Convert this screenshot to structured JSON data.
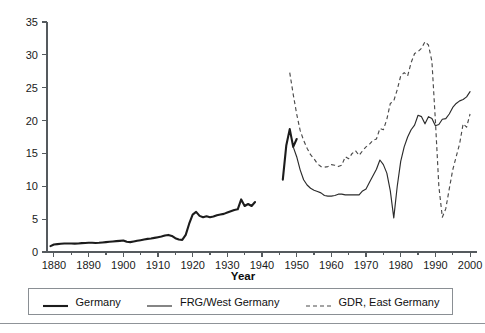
{
  "figure": {
    "background_color": "#ffffff",
    "frame_color": "#8a8f94"
  },
  "chart_data": {
    "type": "line",
    "title": "",
    "subtitle": "",
    "xlabel": "Year",
    "ylabel": "",
    "xlim": [
      1878,
      2002
    ],
    "ylim": [
      0,
      35
    ],
    "grid": false,
    "legend_position": "bottom",
    "x_ticks_major": [
      1880,
      1890,
      1900,
      1910,
      1920,
      1930,
      1940,
      1950,
      1960,
      1970,
      1980,
      1990,
      2000
    ],
    "x_tick_labels": [
      "1880",
      "1890",
      "1900",
      "1910",
      "1920",
      "1930",
      "1940",
      "1950",
      "1960",
      "1970",
      "1980",
      "1990",
      "2000"
    ],
    "x_ticks_minor": [
      1885,
      1895,
      1905,
      1915,
      1925,
      1935,
      1945,
      1955,
      1965,
      1975,
      1985,
      1995
    ],
    "y_ticks_major": [
      0,
      5,
      10,
      15,
      20,
      25,
      30,
      35
    ],
    "y_tick_labels": [
      "0",
      "5",
      "10",
      "15",
      "20",
      "25",
      "30",
      "35"
    ],
    "series": [
      {
        "name": "Germany",
        "style": "solid-thick",
        "color": "#1c1c1c",
        "x": [
          1879,
          1880,
          1881,
          1882,
          1883,
          1884,
          1885,
          1886,
          1887,
          1888,
          1889,
          1890,
          1891,
          1892,
          1893,
          1894,
          1895,
          1896,
          1897,
          1898,
          1899,
          1900,
          1901,
          1902,
          1903,
          1904,
          1905,
          1906,
          1907,
          1908,
          1909,
          1910,
          1911,
          1912,
          1913,
          1914,
          1915,
          1916,
          1917,
          1918,
          1919,
          1920,
          1921,
          1922,
          1923,
          1924,
          1925,
          1926,
          1927,
          1928,
          1929,
          1930,
          1931,
          1932,
          1933,
          1934,
          1935,
          1936,
          1937,
          1938,
          1946,
          1947,
          1948,
          1949,
          1950
        ],
        "values": [
          0.9,
          1.15,
          1.2,
          1.25,
          1.3,
          1.3,
          1.3,
          1.28,
          1.3,
          1.35,
          1.38,
          1.4,
          1.4,
          1.38,
          1.4,
          1.45,
          1.5,
          1.55,
          1.6,
          1.65,
          1.7,
          1.75,
          1.55,
          1.5,
          1.6,
          1.7,
          1.8,
          1.9,
          2.0,
          2.05,
          2.15,
          2.25,
          2.35,
          2.5,
          2.6,
          2.45,
          2.1,
          1.9,
          1.85,
          2.6,
          4.3,
          5.7,
          6.1,
          5.5,
          5.3,
          5.45,
          5.3,
          5.4,
          5.6,
          5.7,
          5.8,
          6.0,
          6.2,
          6.4,
          6.5,
          8.0,
          7.0,
          7.3,
          7.0,
          7.6,
          11.0,
          16.2,
          18.7,
          16.0,
          17.2
        ]
      },
      {
        "name": "FRG/West Germany",
        "style": "solid-thin",
        "color": "#2b2b2b",
        "x": [
          1949,
          1950,
          1951,
          1952,
          1953,
          1954,
          1955,
          1956,
          1957,
          1958,
          1959,
          1960,
          1961,
          1962,
          1963,
          1964,
          1965,
          1966,
          1967,
          1968,
          1969,
          1970,
          1971,
          1972,
          1973,
          1974,
          1975,
          1976,
          1977,
          1978,
          1979,
          1980,
          1981,
          1982,
          1983,
          1984,
          1985,
          1986,
          1987,
          1988,
          1989,
          1990,
          1991,
          1992,
          1993,
          1994,
          1995,
          1996,
          1997,
          1998,
          1999,
          2000
        ],
        "values": [
          16.0,
          14.5,
          12.5,
          11.0,
          10.2,
          9.7,
          9.4,
          9.2,
          9.0,
          8.6,
          8.5,
          8.5,
          8.6,
          8.8,
          8.8,
          8.7,
          8.7,
          8.7,
          8.7,
          8.7,
          9.3,
          9.6,
          10.6,
          11.6,
          12.6,
          14.0,
          13.3,
          12.0,
          9.3,
          5.2,
          10.0,
          13.8,
          16.0,
          17.5,
          18.6,
          19.3,
          20.8,
          20.6,
          19.5,
          20.6,
          20.3,
          19.2,
          19.4,
          20.2,
          20.3,
          21.0,
          22.0,
          22.6,
          23.0,
          23.2,
          23.6,
          24.4
        ]
      },
      {
        "name": "GDR, East Germany",
        "style": "dashed",
        "color": "#4a4a4a",
        "x": [
          1948,
          1949,
          1950,
          1951,
          1952,
          1953,
          1954,
          1955,
          1956,
          1957,
          1958,
          1959,
          1960,
          1961,
          1962,
          1963,
          1964,
          1965,
          1966,
          1967,
          1968,
          1969,
          1970,
          1971,
          1972,
          1973,
          1974,
          1975,
          1976,
          1977,
          1978,
          1979,
          1980,
          1981,
          1982,
          1983,
          1984,
          1985,
          1986,
          1987,
          1988,
          1989,
          1990,
          1991,
          1992,
          1993,
          1994,
          1995,
          1996,
          1997,
          1998,
          1999,
          2000
        ],
        "values": [
          27.3,
          24.0,
          21.0,
          18.5,
          17.0,
          15.8,
          14.8,
          14.2,
          13.4,
          13.0,
          12.9,
          13.0,
          13.3,
          13.2,
          13.0,
          13.2,
          14.5,
          14.2,
          15.0,
          15.4,
          14.7,
          15.4,
          16.0,
          16.4,
          17.0,
          17.2,
          18.8,
          18.6,
          20.2,
          22.6,
          23.0,
          24.7,
          26.8,
          27.3,
          26.8,
          28.8,
          30.2,
          30.5,
          31.0,
          32.0,
          31.5,
          29.0,
          20.0,
          10.0,
          5.3,
          6.6,
          9.6,
          12.5,
          14.5,
          16.5,
          19.5,
          19.0,
          21.0
        ]
      }
    ]
  },
  "legend": {
    "entries": [
      {
        "label": "Germany",
        "style": "solid-thick",
        "color": "#1c1c1c"
      },
      {
        "label": "FRG/West Germany",
        "style": "solid-thin",
        "color": "#2b2b2b"
      },
      {
        "label": "GDR, East Germany",
        "style": "dashed",
        "color": "#4a4a4a"
      }
    ]
  }
}
